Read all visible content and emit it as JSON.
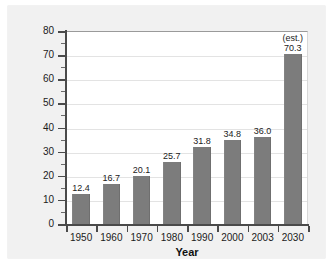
{
  "chart_data": {
    "type": "bar",
    "title": "",
    "xlabel": "Year",
    "ylabel": "Number over age 65 (in millions)",
    "categories": [
      "1950",
      "1960",
      "1970",
      "1980",
      "1990",
      "2000",
      "2003",
      "2030"
    ],
    "values": [
      12.4,
      16.7,
      20.1,
      25.7,
      31.8,
      34.8,
      36.0,
      70.3
    ],
    "value_labels": [
      "12.4",
      "16.7",
      "20.1",
      "25.7",
      "31.8",
      "34.8",
      "36.0",
      "70.3"
    ],
    "annotations": [
      {
        "category": "2030",
        "text": "(est.)"
      }
    ],
    "ylim": [
      0,
      80
    ],
    "y_major_step": 10,
    "y_minor_step": 5,
    "y_tick_labels": [
      "0",
      "10",
      "20",
      "30",
      "40",
      "50",
      "60",
      "70",
      "80"
    ],
    "grid": "horizontal",
    "legend": "none",
    "bar_color": "#7c7c7c",
    "plot_background": "#ffffff",
    "panel_background": "#f1f1f1",
    "gridline_color": "#e3e3e3",
    "axis_color": "#4a4a4a",
    "text_color": "#1b1b1b"
  }
}
